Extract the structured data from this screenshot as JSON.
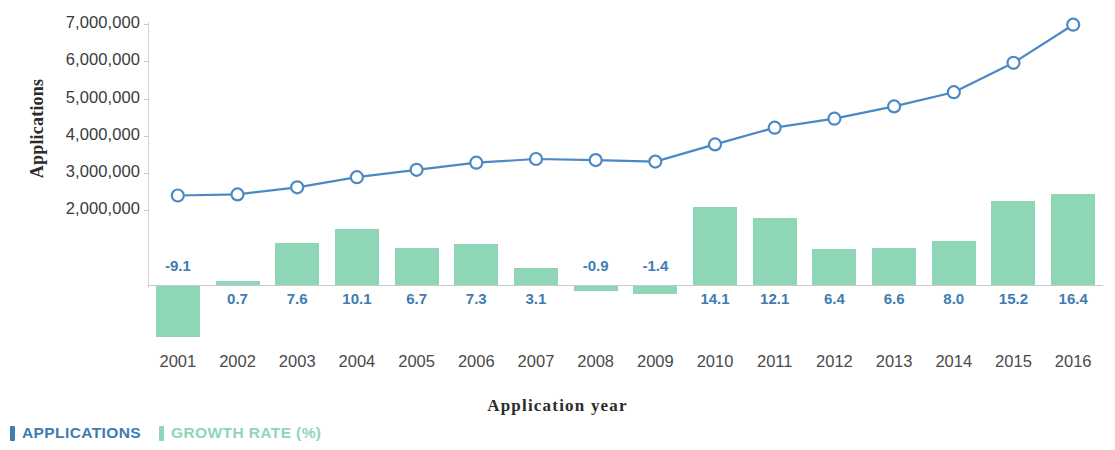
{
  "chart_data": {
    "type": "bar",
    "title": "",
    "xlabel": "Application year",
    "ylabel": "Applications",
    "categories": [
      "2001",
      "2002",
      "2003",
      "2004",
      "2005",
      "2006",
      "2007",
      "2008",
      "2009",
      "2010",
      "2011",
      "2012",
      "2013",
      "2014",
      "2015",
      "2016"
    ],
    "ylim": [
      0,
      7000000
    ],
    "y_ticks": [
      "2,000,000",
      "3,000,000",
      "4,000,000",
      "5,000,000",
      "6,000,000",
      "7,000,000"
    ],
    "y_tick_values": [
      2000000,
      3000000,
      4000000,
      5000000,
      6000000,
      7000000
    ],
    "grid": false,
    "legend_position": "bottom-left",
    "series": [
      {
        "name": "APPLICATIONS",
        "type": "line",
        "axis": "left",
        "color": "#4a89c4",
        "marker": "open-circle",
        "values": [
          2400000,
          2430000,
          2620000,
          2890000,
          3090000,
          3280000,
          3380000,
          3350000,
          3310000,
          3770000,
          4220000,
          4460000,
          4790000,
          5170000,
          5960000,
          6980000
        ]
      },
      {
        "name": "GROWTH RATE (%)",
        "type": "bar",
        "axis": "right",
        "color": "#8ed6b5",
        "values": [
          -9.1,
          0.7,
          7.6,
          10.1,
          6.7,
          7.3,
          3.1,
          -0.9,
          -1.4,
          14.1,
          12.1,
          6.4,
          6.6,
          8.0,
          15.2,
          16.4
        ],
        "value_labels": [
          "-9.1",
          "0.7",
          "7.6",
          "10.1",
          "6.7",
          "7.3",
          "3.1",
          "-0.9",
          "-1.4",
          "14.1",
          "12.1",
          "6.4",
          "6.6",
          "8.0",
          "15.2",
          "16.4"
        ]
      }
    ]
  },
  "axis": {
    "y_title": "Applications",
    "x_title": "Application year"
  },
  "legend": {
    "items": [
      {
        "label": "APPLICATIONS",
        "color": "#3e7cb1"
      },
      {
        "label": "GROWTH RATE (%)",
        "color": "#8ed6b5"
      }
    ]
  },
  "colors": {
    "line": "#4a89c4",
    "marker_fill": "#ffffff",
    "bar": "#8ed6b5",
    "growth_label": "#3e7cb1",
    "axis": "#c9c9c9",
    "tick_text": "#3a3a3a"
  }
}
